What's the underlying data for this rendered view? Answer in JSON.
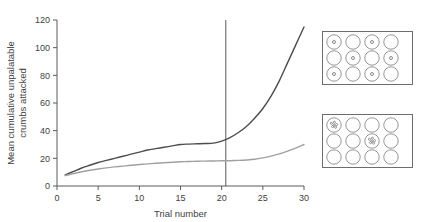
{
  "chart_data": {
    "type": "line",
    "title": "",
    "xlabel": "Trial number",
    "ylabel": "Mean cumulative unpalatable crumbs attacked",
    "xlim": [
      0,
      30
    ],
    "ylim": [
      0,
      120
    ],
    "xticks": [
      0,
      5,
      10,
      15,
      20,
      25,
      30
    ],
    "yticks": [
      0,
      20,
      40,
      60,
      80,
      100,
      120
    ],
    "grid": false,
    "legend": "none",
    "annotations": [
      {
        "type": "vline",
        "x": 20.5,
        "label": ""
      }
    ],
    "x": [
      1,
      2,
      3,
      4,
      5,
      6,
      7,
      8,
      9,
      10,
      11,
      12,
      13,
      14,
      15,
      16,
      17,
      18,
      19,
      20,
      21,
      22,
      23,
      24,
      25,
      26,
      27,
      28,
      29,
      30
    ],
    "series": [
      {
        "name": "dark-curve",
        "color": "#4d4d4d",
        "values": [
          8,
          10.5,
          13,
          15,
          17,
          18.5,
          20,
          21.5,
          23,
          24.5,
          26,
          27,
          28,
          29,
          30,
          30.3,
          30.5,
          30.7,
          31,
          32.5,
          35,
          38.5,
          43,
          49,
          56,
          65,
          76,
          89,
          102,
          115
        ]
      },
      {
        "name": "light-curve",
        "color": "#a0a0a0",
        "values": [
          7.5,
          9,
          10.3,
          11.4,
          12.3,
          13.1,
          13.8,
          14.4,
          15,
          15.5,
          16,
          16.4,
          16.8,
          17.2,
          17.5,
          17.7,
          17.9,
          18,
          18.1,
          18.2,
          18.3,
          18.5,
          18.8,
          19.3,
          20.3,
          21.6,
          23.2,
          25.2,
          27.4,
          30
        ]
      }
    ]
  },
  "axes": {
    "xlabel": "Trial number",
    "ylabel_line1": "Mean cumulative unpalatable",
    "ylabel_line2": "crumbs attacked",
    "xticks": [
      "0",
      "5",
      "10",
      "15",
      "20",
      "25",
      "30"
    ],
    "yticks": [
      "0",
      "20",
      "40",
      "60",
      "80",
      "100",
      "120"
    ]
  },
  "panels": {
    "top": {
      "name": "grid-panel-top",
      "rows": 3,
      "cols": 4,
      "marker": "dot",
      "filled_cells": [
        [
          0,
          0
        ],
        [
          0,
          2
        ],
        [
          1,
          1
        ],
        [
          1,
          3
        ],
        [
          2,
          0
        ],
        [
          2,
          2
        ]
      ]
    },
    "bottom": {
      "name": "grid-panel-bottom",
      "rows": 3,
      "cols": 4,
      "marker": "crumb",
      "filled_cells": [
        [
          0,
          0
        ],
        [
          1,
          2
        ]
      ]
    }
  },
  "colors": {
    "dark_curve": "#4d4d4d",
    "light_curve": "#a0a0a0",
    "axis": "#5a5a5a",
    "text": "#3f3f3f",
    "panel_border": "#6d6d6d",
    "circle_stroke": "#8a8a8a",
    "background": "#ffffff"
  }
}
